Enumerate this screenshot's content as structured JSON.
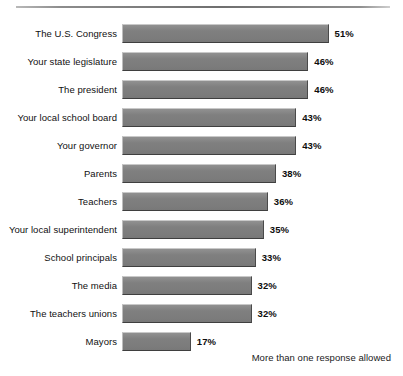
{
  "chart_data": {
    "type": "bar",
    "orientation": "horizontal",
    "title": "",
    "subtitle": "",
    "xlabel": "",
    "ylabel": "",
    "xlim": [
      0,
      51
    ],
    "grid": false,
    "legend": null,
    "value_suffix": "%",
    "annotation": "More than one response allowed",
    "categories": [
      "The U.S. Congress",
      "Your state legislature",
      "The president",
      "Your local school board",
      "Your governor",
      "Parents",
      "Teachers",
      "Your local superintendent",
      "School principals",
      "The media",
      "The teachers unions",
      "Mayors"
    ],
    "values": [
      51,
      46,
      46,
      43,
      43,
      38,
      36,
      35,
      33,
      32,
      32,
      17
    ],
    "value_labels": [
      "51%",
      "46%",
      "46%",
      "43%",
      "43%",
      "38%",
      "36%",
      "35%",
      "33%",
      "32%",
      "32%",
      "17%"
    ],
    "bars": [
      {
        "label": "The U.S. Congress",
        "value": 51,
        "value_label": "51%"
      },
      {
        "label": "Your state legislature",
        "value": 46,
        "value_label": "46%"
      },
      {
        "label": "The president",
        "value": 46,
        "value_label": "46%"
      },
      {
        "label": "Your local school board",
        "value": 43,
        "value_label": "43%"
      },
      {
        "label": "Your governor",
        "value": 43,
        "value_label": "43%"
      },
      {
        "label": "Parents",
        "value": 38,
        "value_label": "38%"
      },
      {
        "label": "Teachers",
        "value": 36,
        "value_label": "36%"
      },
      {
        "label": "Your local superintendent",
        "value": 35,
        "value_label": "35%"
      },
      {
        "label": "School principals",
        "value": 33,
        "value_label": "33%"
      },
      {
        "label": "The media",
        "value": 32,
        "value_label": "32%"
      },
      {
        "label": "The teachers unions",
        "value": 32,
        "value_label": "32%"
      },
      {
        "label": "Mayors",
        "value": 17,
        "value_label": "17%"
      }
    ],
    "colors": {
      "bar_fill": "#7e7e7e",
      "bar_highlight": "#909090",
      "bar_shadow": "#3f3f3f",
      "background": "#ffffff",
      "text": "#101010",
      "rule": "#6f6f6f"
    }
  },
  "footnote": "More than one response allowed"
}
